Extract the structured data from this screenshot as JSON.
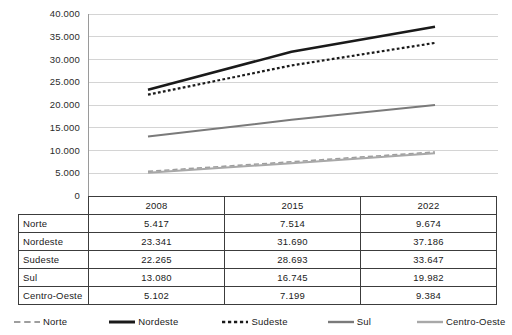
{
  "chart_data": {
    "type": "line",
    "title": "",
    "subtitle": "",
    "xlabel": "",
    "ylabel": "",
    "categories": [
      "2008",
      "2015",
      "2022"
    ],
    "ylim": [
      0,
      40000
    ],
    "y_ticks": [
      0,
      5000,
      10000,
      15000,
      20000,
      25000,
      30000,
      35000,
      40000
    ],
    "y_tick_labels": [
      "0",
      "5.000",
      "10.000",
      "15.000",
      "20.000",
      "25.000",
      "30.000",
      "35.000",
      "40.000"
    ],
    "grid": true,
    "legend_position": "bottom",
    "series": [
      {
        "name": "Norte",
        "values": [
          5417,
          7514,
          9674
        ],
        "color": "#9e9e9e",
        "style": "dashed",
        "width": 1.6
      },
      {
        "name": "Nordeste",
        "values": [
          23341,
          31690,
          37186
        ],
        "color": "#1a1a1a",
        "style": "solid",
        "width": 2.6
      },
      {
        "name": "Sudeste",
        "values": [
          22265,
          28693,
          33647
        ],
        "color": "#1a1a1a",
        "style": "dotted",
        "width": 2.2
      },
      {
        "name": "Sul",
        "values": [
          13080,
          16745,
          19982
        ],
        "color": "#7a7a7a",
        "style": "solid",
        "width": 2.0
      },
      {
        "name": "Centro-Oeste",
        "values": [
          5102,
          7199,
          9384
        ],
        "color": "#a8a8a8",
        "style": "solid",
        "width": 2.0
      }
    ]
  },
  "table": {
    "corner_label": "",
    "columns": [
      "2008",
      "2015",
      "2022"
    ],
    "rows": [
      {
        "label": "Norte",
        "values": [
          "5.417",
          "7.514",
          "9.674"
        ]
      },
      {
        "label": "Nordeste",
        "values": [
          "23.341",
          "31.690",
          "37.186"
        ]
      },
      {
        "label": "Sudeste",
        "values": [
          "22.265",
          "28.693",
          "33.647"
        ]
      },
      {
        "label": "Sul",
        "values": [
          "13.080",
          "16.745",
          "19.982"
        ]
      },
      {
        "label": "Centro-Oeste",
        "values": [
          "5.102",
          "7.199",
          "9.384"
        ]
      }
    ]
  },
  "legend": {
    "items": [
      {
        "label": "Norte",
        "color": "#9e9e9e",
        "style": "dashed"
      },
      {
        "label": "Nordeste",
        "color": "#1a1a1a",
        "style": "solid"
      },
      {
        "label": "Sudeste",
        "color": "#1a1a1a",
        "style": "dotted"
      },
      {
        "label": "Sul",
        "color": "#7a7a7a",
        "style": "solid"
      },
      {
        "label": "Centro-Oeste",
        "color": "#a8a8a8",
        "style": "solid"
      }
    ]
  },
  "colors": {
    "gridline": "#d4d4d4",
    "axis": "#9a9a9a",
    "table_border": "#3c3c3c",
    "text": "#1a1a1a",
    "background": "#ffffff"
  }
}
